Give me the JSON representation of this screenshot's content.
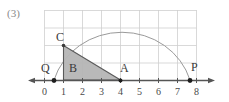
{
  "figure": {
    "problem_label": "(3)",
    "colors": {
      "grid": "#cfcfcf",
      "axis": "#555555",
      "arc": "#9a9a9a",
      "triangle_fill": "#b5b5b5",
      "triangle_stroke": "#5a5a5a",
      "text": "#3a3a3a"
    },
    "points": [
      {
        "name": "Q",
        "label": "Q",
        "x": 0.5,
        "y": 0
      },
      {
        "name": "C",
        "label": "C",
        "x": 1,
        "y": 3
      },
      {
        "name": "B",
        "label": "B",
        "x": 1.6,
        "y": 0.5
      },
      {
        "name": "A",
        "label": "A",
        "x": 4,
        "y": 0
      },
      {
        "name": "P",
        "label": "P",
        "x": 7.7,
        "y": 0
      }
    ],
    "axis": {
      "ticks": [
        "0",
        "1",
        "2",
        "3",
        "4",
        "5",
        "6",
        "7",
        "8"
      ],
      "min": 0,
      "max": 8
    },
    "grid": {
      "x_lines": [
        0,
        1,
        2,
        3,
        4,
        5,
        6,
        7,
        8
      ],
      "y_lines": [
        0,
        1,
        2,
        3,
        4
      ]
    },
    "arc": {
      "type": "semicircle",
      "start_x": 0.5,
      "end_x": 7.7,
      "peak_y": 3.65
    },
    "triangle": {
      "vertices": [
        [
          1,
          3
        ],
        [
          1,
          0
        ],
        [
          4,
          0
        ]
      ],
      "region_label": "B"
    }
  }
}
